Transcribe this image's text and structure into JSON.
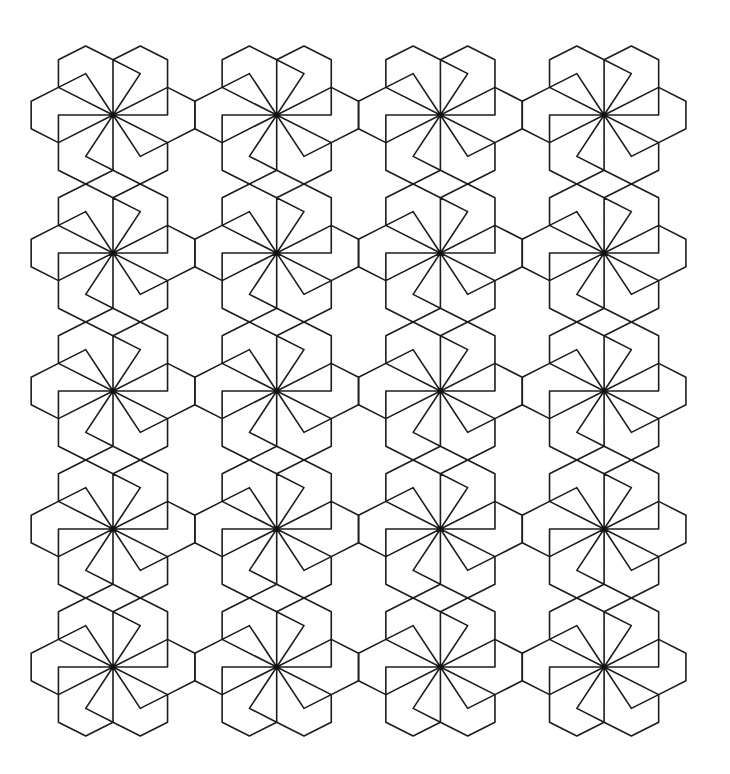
{
  "pattern": {
    "description": "Pinwheel hexagon tessellation",
    "background": "#ffffff",
    "stroke_color": "#1c1c1c",
    "stroke_width": 1.6,
    "grid": {
      "columns": 4,
      "rows": 5,
      "origin": [
        113,
        115
      ],
      "spacing": [
        163.7,
        138
      ],
      "unit": [
        27.28,
        13.8
      ]
    },
    "motif": {
      "outline": [
        [
          0,
          -4
        ],
        [
          1,
          -5
        ],
        [
          2,
          -4
        ],
        [
          2,
          -2
        ],
        [
          3,
          -1
        ],
        [
          3,
          1
        ],
        [
          2,
          2
        ],
        [
          2,
          4
        ],
        [
          1,
          5
        ],
        [
          0,
          4
        ],
        [
          -1,
          5
        ],
        [
          -2,
          4
        ],
        [
          -2,
          2
        ],
        [
          -3,
          1
        ],
        [
          -3,
          -1
        ],
        [
          -2,
          -2
        ],
        [
          -2,
          -4
        ],
        [
          -1,
          -5
        ],
        [
          0,
          -4
        ]
      ],
      "rays": [
        [
          0,
          -4
        ],
        [
          2,
          -2
        ],
        [
          2,
          2
        ],
        [
          0,
          4
        ],
        [
          -2,
          2
        ],
        [
          -2,
          -2
        ],
        [
          1,
          -3
        ],
        [
          2,
          0
        ],
        [
          1,
          3
        ],
        [
          -1,
          3
        ],
        [
          -2,
          0
        ],
        [
          -1,
          -3
        ]
      ],
      "tip_edges": [
        [
          [
            1,
            -3
          ],
          [
            0,
            -4
          ]
        ],
        [
          [
            2,
            0
          ],
          [
            2,
            -2
          ]
        ],
        [
          [
            1,
            3
          ],
          [
            2,
            2
          ]
        ],
        [
          [
            -1,
            3
          ],
          [
            0,
            4
          ]
        ],
        [
          [
            -2,
            0
          ],
          [
            -2,
            2
          ]
        ],
        [
          [
            -1,
            -3
          ],
          [
            -2,
            -2
          ]
        ]
      ]
    }
  }
}
